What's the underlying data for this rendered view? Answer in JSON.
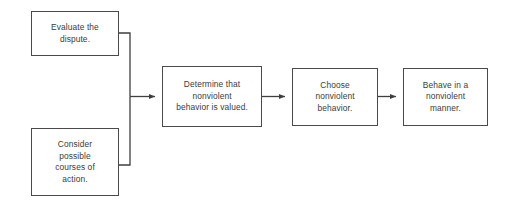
{
  "diagram": {
    "background_color": "#ffffff",
    "box_border_color": "#4a4a4a",
    "connector_color": "#3f3f3f",
    "text_color": "#3b3b3b",
    "nodes": [
      {
        "id": "evaluate-dispute",
        "label": "Evaluate the\ndispute.",
        "x": 31,
        "y": 11,
        "width": 88,
        "height": 45
      },
      {
        "id": "consider-courses",
        "label": "Consider\npossible\ncourses of\naction.",
        "x": 31,
        "y": 128,
        "width": 88,
        "height": 68
      },
      {
        "id": "determine-valued",
        "label": "Determine that\nnonviolent\nbehavior is valued.",
        "x": 162,
        "y": 66,
        "width": 100,
        "height": 61
      },
      {
        "id": "choose-behavior",
        "label": "Choose\nnonviolent\nbehavior.",
        "x": 292,
        "y": 68,
        "width": 86,
        "height": 58
      },
      {
        "id": "behave-manner",
        "label": "Behave in a\nnonviolent\nmanner.",
        "x": 403,
        "y": 68,
        "width": 85,
        "height": 58
      }
    ],
    "connectors": [
      {
        "id": "evaluate-to-junction",
        "from": "evaluate-dispute",
        "to": "determine-valued",
        "type": "elbow-arrow"
      },
      {
        "id": "consider-to-junction",
        "from": "consider-courses",
        "to": "determine-valued",
        "type": "elbow-arrow"
      },
      {
        "id": "determine-to-choose",
        "from": "determine-valued",
        "to": "choose-behavior",
        "type": "straight-arrow"
      },
      {
        "id": "choose-to-behave",
        "from": "choose-behavior",
        "to": "behave-manner",
        "type": "straight-arrow"
      }
    ]
  }
}
